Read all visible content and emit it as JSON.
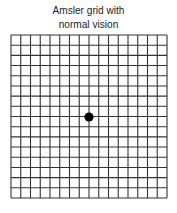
{
  "title": {
    "line1": "Amsler grid with",
    "line2": "normal vision"
  },
  "grid": {
    "columns": 16,
    "rows": 16,
    "left": 11,
    "top": 35,
    "right": 167,
    "bottom": 198,
    "line_color": "#333333",
    "line_width": 1.1
  },
  "center_dot": {
    "cx": 89,
    "cy": 117,
    "r": 4.6,
    "color": "#000000"
  }
}
